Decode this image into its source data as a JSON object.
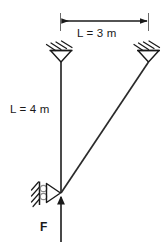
{
  "figure": {
    "background_color": "#ffffff",
    "line_color": "#1a1a1a",
    "labels": {
      "span_top": "L = 3 m",
      "length_left": "L = 4 m",
      "force": "F"
    },
    "dimension": {
      "span_value": "3",
      "span_unit": "m",
      "arrow_style": "double-headed"
    },
    "members": [
      {
        "name": "vertical-member",
        "label": "L = 4 m",
        "length_value": "4",
        "length_unit": "m",
        "from": "top-left-pin-support",
        "to": "bottom-joint"
      },
      {
        "name": "diagonal-member",
        "from": "bottom-joint",
        "to": "top-right-pin-support"
      }
    ],
    "supports": [
      {
        "name": "top-left-pin-support",
        "type": "pin",
        "orientation": "ceiling"
      },
      {
        "name": "top-right-pin-support",
        "type": "pin",
        "orientation": "ceiling"
      },
      {
        "name": "bottom-roller-support",
        "type": "roller",
        "orientation": "wall-left"
      }
    ],
    "load": {
      "name": "applied-force",
      "symbol": "F",
      "direction": "up"
    }
  }
}
